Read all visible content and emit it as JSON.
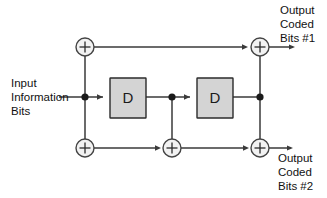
{
  "diagram": {
    "colors": {
      "wire": "#3a3a3a",
      "register_fill": "#d4d4d4",
      "register_stroke": "#2b2b2b",
      "xor_fill": "#f2f2f2",
      "xor_stroke": "#444444",
      "text": "#111111",
      "background": "#ffffff"
    },
    "labels": {
      "input_line1": "Input",
      "input_line2": "Information",
      "input_line3": "Bits",
      "output1_line1": "Output",
      "output1_line2": "Coded",
      "output1_line3": "Bits #1",
      "output2_line1": "Output",
      "output2_line2": "Coded",
      "output2_line3": "Bits #2"
    },
    "registers": [
      {
        "id": "d1",
        "label": "D",
        "x": 110,
        "y": 78,
        "w": 36,
        "h": 40
      },
      {
        "id": "d2",
        "label": "D",
        "x": 197,
        "y": 78,
        "w": 36,
        "h": 40
      }
    ],
    "adders": [
      {
        "id": "xor-top-left",
        "symbol": "+",
        "cx": 85,
        "cy": 47,
        "r": 9
      },
      {
        "id": "xor-top-right",
        "symbol": "+",
        "cx": 260,
        "cy": 47,
        "r": 9
      },
      {
        "id": "xor-bottom-left",
        "symbol": "+",
        "cx": 85,
        "cy": 148,
        "r": 9
      },
      {
        "id": "xor-bottom-mid",
        "symbol": "+",
        "cx": 172,
        "cy": 148,
        "r": 9
      },
      {
        "id": "xor-bottom-right",
        "symbol": "+",
        "cx": 260,
        "cy": 148,
        "r": 9
      }
    ],
    "junctions": [
      {
        "id": "tap-input",
        "cx": 85,
        "cy": 97,
        "r": 3.6
      },
      {
        "id": "tap-middle",
        "cx": 172,
        "cy": 97,
        "r": 3.6
      },
      {
        "id": "tap-right",
        "cx": 260,
        "cy": 97,
        "r": 3.6
      }
    ]
  }
}
